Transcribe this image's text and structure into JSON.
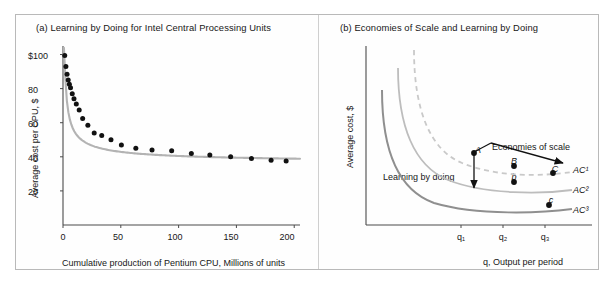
{
  "figure": {
    "panels": [
      {
        "id": "a",
        "title": "(a) Learning by Doing for Intel Central Processing Units",
        "xlabel": "Cumulative production of Pentium CPU, Millions of units",
        "ylabel": "Average cost per CPU, $",
        "xticks": [
          "0",
          "50",
          "100",
          "150",
          "200"
        ],
        "yticks": [
          "20",
          "40",
          "60",
          "80",
          "$100"
        ]
      },
      {
        "id": "b",
        "title": "(b) Economies of Scale and Learning by Doing",
        "xlabel": "q, Output per period",
        "ylabel": "Average cost, $",
        "xticks": [
          "q₁",
          "q₂",
          "q₃"
        ],
        "curve_labels": [
          "AC¹",
          "AC²",
          "AC³"
        ],
        "annotations": [
          "Economies of scale",
          "Learning by doing"
        ],
        "point_labels": [
          "A",
          "B",
          "C",
          "b",
          "c"
        ]
      }
    ]
  },
  "chart_data": [
    {
      "type": "scatter",
      "panel": "a",
      "title": "(a) Learning by Doing for Intel Central Processing Units",
      "xlabel": "Cumulative production of Pentium CPU, Millions of units",
      "ylabel": "Average cost per CPU, $",
      "xlim": [
        0,
        205
      ],
      "ylim": [
        0,
        105
      ],
      "xticks": [
        0,
        50,
        100,
        150,
        200
      ],
      "ytick_values": [
        20,
        40,
        60,
        80,
        100
      ],
      "ytick_labels": [
        "20",
        "40",
        "60",
        "80",
        "$100"
      ],
      "grid": false,
      "legend": "none",
      "series": [
        {
          "name": "Average cost per Pentium CPU",
          "marker": "filled-circle",
          "color": "#111111",
          "x": [
            1.5,
            2.5,
            3.5,
            4.5,
            5.5,
            6.5,
            8.0,
            9.5,
            11.5,
            14.0,
            17.0,
            21.5,
            27.0,
            33.5,
            41.5,
            50.5,
            63.0,
            77.0,
            94.0,
            111.0,
            127.0,
            145.0,
            163.0,
            180.0,
            193.0
          ],
          "y": [
            99.5,
            93.0,
            88.5,
            85.0,
            82.5,
            80.5,
            77.0,
            74.0,
            71.0,
            67.5,
            62.5,
            58.5,
            54.0,
            52.5,
            50.0,
            47.0,
            45.0,
            44.0,
            43.5,
            42.0,
            41.0,
            40.0,
            39.0,
            38.0,
            37.5
          ]
        }
      ],
      "fit_curve": {
        "name": "learning curve (fitted)",
        "style": "solid",
        "color": "#b3b3b3",
        "description": "Smooth decreasing power-law learning curve from about $100 at very low cumulative output to about $37 at 200 million units"
      }
    },
    {
      "type": "line",
      "panel": "b",
      "title": "(b) Economies of Scale and Learning by Doing",
      "xlabel": "q, Output per period",
      "ylabel": "Average cost, $",
      "xtick_labels": [
        "q₁",
        "q₂",
        "q₃"
      ],
      "axes_numeric": false,
      "grid": false,
      "legend": "curve-labels",
      "series": [
        {
          "name": "AC¹",
          "style": "dashed",
          "color": "#c9c9c9",
          "label_text": "AC¹"
        },
        {
          "name": "AC²",
          "style": "solid",
          "color": "#bdbdbd",
          "label_text": "AC²"
        },
        {
          "name": "AC³",
          "style": "solid",
          "color": "#8f8f8f",
          "label_text": "AC³"
        }
      ],
      "points": [
        {
          "label": "A",
          "curve": "AC¹",
          "x_tick": "q₁"
        },
        {
          "label": "B",
          "curve": "AC¹",
          "x_tick": "q₂"
        },
        {
          "label": "C",
          "curve": "AC¹",
          "x_tick": "q₃"
        },
        {
          "label": "b",
          "curve": "AC²",
          "x_tick": "q₂"
        },
        {
          "label": "c",
          "curve": "AC³",
          "x_tick": "q₃"
        }
      ],
      "annotations": [
        {
          "text": "Economies of scale",
          "arrow": "down-right",
          "from": "A",
          "to": "C"
        },
        {
          "text": "Learning by doing",
          "arrow": "down",
          "from": "A",
          "to": "below AC²"
        }
      ]
    }
  ]
}
